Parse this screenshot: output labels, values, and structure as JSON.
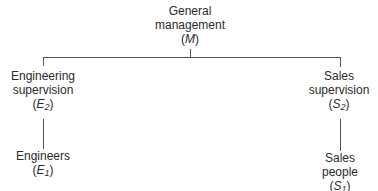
{
  "diagram": {
    "type": "org-chart",
    "nodes": [
      {
        "id": "M",
        "line1": "General",
        "line2": "management",
        "symbol": "M",
        "subscript": ""
      },
      {
        "id": "E2",
        "line1": "Engineering",
        "line2": "supervision",
        "symbol": "E",
        "subscript": "2"
      },
      {
        "id": "S2",
        "line1": "Sales",
        "line2": "supervision",
        "symbol": "S",
        "subscript": "2"
      },
      {
        "id": "E1",
        "line1": "Engineers",
        "line2": "",
        "symbol": "E",
        "subscript": "1"
      },
      {
        "id": "S1",
        "line1": "Sales",
        "line2": "people",
        "symbol": "S",
        "subscript": "1"
      }
    ],
    "edges": [
      {
        "from": "M",
        "to": "E2"
      },
      {
        "from": "M",
        "to": "S2"
      },
      {
        "from": "E2",
        "to": "E1"
      },
      {
        "from": "S2",
        "to": "S1"
      }
    ],
    "line_color": "#555555"
  }
}
